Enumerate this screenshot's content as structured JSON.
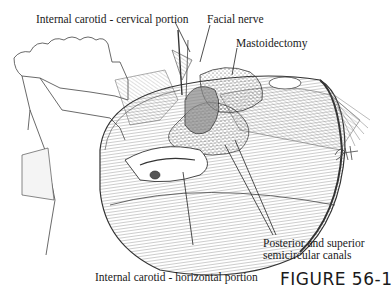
{
  "figure": {
    "caption": "FIGURE 56-1",
    "signature": "SAH",
    "labels": {
      "carotid_cervical": "Internal carotid - cervical portion",
      "facial_nerve": "Facial nerve",
      "mastoidectomy": "Mastoidectomy",
      "canals_line1": "Posterior and superior",
      "canals_line2": "semicircular canals",
      "carotid_horizontal": "Internal carotid - horizontal portion"
    },
    "colors": {
      "ink": "#1a1a1a",
      "background": "#ffffff"
    }
  }
}
